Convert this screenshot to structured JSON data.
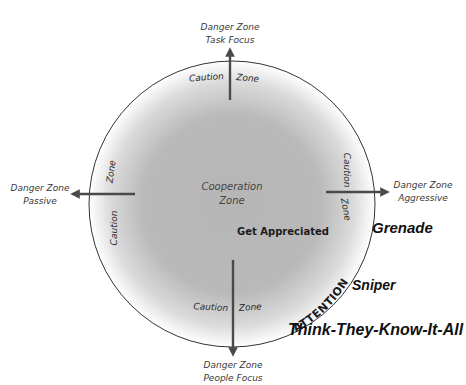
{
  "diagram": {
    "type": "zone-circle",
    "center_zone": {
      "line1": "Cooperation",
      "line2": "Zone"
    },
    "ring_label": {
      "caution": "Caution",
      "zone": "Zone"
    },
    "axes": {
      "top": {
        "line1": "Danger Zone",
        "line2": "Task Focus"
      },
      "bottom": {
        "line1": "Danger Zone",
        "line2": "People Focus"
      },
      "left": {
        "line1": "Danger Zone",
        "line2": "Passive"
      },
      "right": {
        "line1": "Danger Zone",
        "line2": "Aggressive"
      }
    },
    "intent_label": "Get Appreciated",
    "arc_label": "ATTENTION",
    "behaviors": [
      "Grenade",
      "Sniper",
      "Think-They-Know-It-All"
    ],
    "colors": {
      "fill_center": "#b8b8b8",
      "fill_edge": "#ffffff",
      "stroke": "#333333",
      "arrow": "#4a4a4a"
    }
  }
}
